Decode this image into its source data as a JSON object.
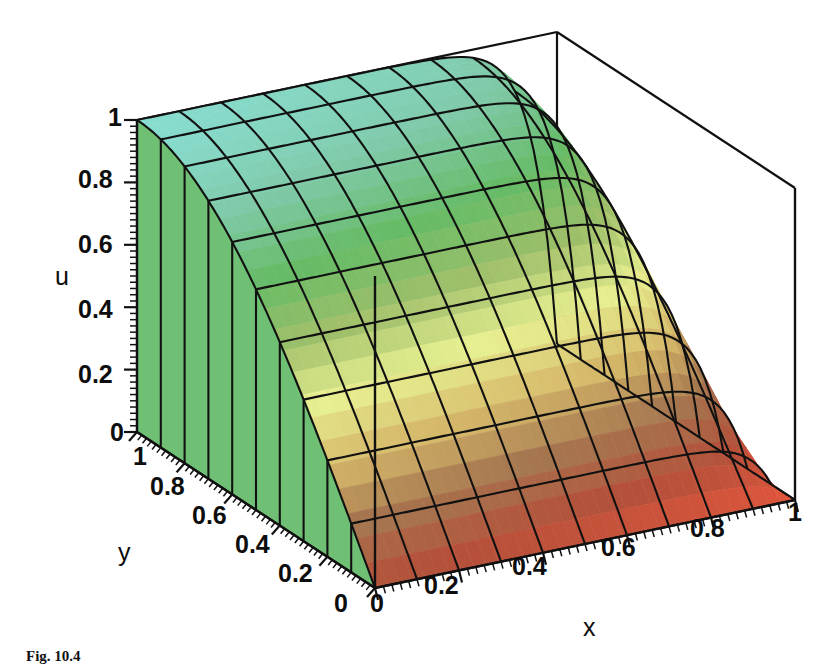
{
  "figure": {
    "caption": "Fig. 10.4",
    "background_color": "#ffffff",
    "line_color": "#111111"
  },
  "axes": {
    "u": {
      "name": "u",
      "name_pos": {
        "x": 55,
        "y": 262
      },
      "ticks": [
        {
          "label": "1",
          "value": 1.0,
          "x": 108,
          "y": 103
        },
        {
          "label": "0.8",
          "value": 0.8,
          "x": 78,
          "y": 165
        },
        {
          "label": "0.6",
          "value": 0.6,
          "x": 78,
          "y": 230
        },
        {
          "label": "0.4",
          "value": 0.4,
          "x": 78,
          "y": 295
        },
        {
          "label": "0.2",
          "value": 0.2,
          "x": 78,
          "y": 360
        },
        {
          "label": "0",
          "value": 0.0,
          "x": 110,
          "y": 418
        }
      ]
    },
    "y": {
      "name": "y",
      "name_pos": {
        "x": 118,
        "y": 538
      },
      "ticks": [
        {
          "label": "1",
          "value": 1.0,
          "x": 133,
          "y": 442
        },
        {
          "label": "0.8",
          "value": 0.8,
          "x": 150,
          "y": 472
        },
        {
          "label": "0.6",
          "value": 0.6,
          "x": 192,
          "y": 501
        },
        {
          "label": "0.4",
          "value": 0.4,
          "x": 235,
          "y": 530
        },
        {
          "label": "0.2",
          "value": 0.2,
          "x": 278,
          "y": 559
        },
        {
          "label": "0",
          "value": 0.0,
          "x": 334,
          "y": 589
        }
      ]
    },
    "x": {
      "name": "x",
      "name_pos": {
        "x": 583,
        "y": 613
      },
      "ticks": [
        {
          "label": "0",
          "value": 0.0,
          "x": 370,
          "y": 589
        },
        {
          "label": "0.2",
          "value": 0.2,
          "x": 424,
          "y": 571
        },
        {
          "label": "0.4",
          "value": 0.4,
          "x": 512,
          "y": 552
        },
        {
          "label": "0.6",
          "value": 0.6,
          "x": 601,
          "y": 533
        },
        {
          "label": "0.8",
          "value": 0.8,
          "x": 690,
          "y": 514
        },
        {
          "label": "1",
          "value": 1.0,
          "x": 788,
          "y": 498
        }
      ]
    }
  },
  "chart_data": {
    "type": "surface3d",
    "title": "",
    "xlabel": "x",
    "ylabel": "y",
    "zlabel": "u",
    "xlim": [
      0,
      1
    ],
    "ylim": [
      0,
      1
    ],
    "zlim": [
      0,
      1
    ],
    "grid": true,
    "legend": "none",
    "mesh_nx": 11,
    "mesh_ny": 11,
    "colormap": [
      "#88ddd0",
      "#7fc9a8",
      "#66bb66",
      "#9fbf6a",
      "#e7ef90",
      "#d6b96a",
      "#a5764f",
      "#b4503a",
      "#e2563c"
    ],
    "x": [
      0,
      0.1,
      0.2,
      0.3,
      0.4,
      0.5,
      0.6,
      0.7,
      0.8,
      0.9,
      1.0
    ],
    "y": [
      0,
      0.1,
      0.2,
      0.3,
      0.4,
      0.5,
      0.6,
      0.7,
      0.8,
      0.9,
      1.0
    ],
    "z_rows": [
      {
        "y": 1.0,
        "values": [
          1.0,
          1.0,
          1.0,
          1.0,
          1.0,
          1.0,
          1.0,
          1.0,
          1.0,
          1.0,
          0.0
        ]
      },
      {
        "y": 0.9,
        "values": [
          0.97,
          0.97,
          0.97,
          0.97,
          0.97,
          0.97,
          0.97,
          0.96,
          0.95,
          0.9,
          0.0
        ]
      },
      {
        "y": 0.8,
        "values": [
          0.92,
          0.92,
          0.92,
          0.92,
          0.92,
          0.92,
          0.91,
          0.9,
          0.87,
          0.78,
          0.0
        ]
      },
      {
        "y": 0.7,
        "values": [
          0.84,
          0.84,
          0.84,
          0.84,
          0.84,
          0.83,
          0.82,
          0.8,
          0.75,
          0.63,
          0.0
        ]
      },
      {
        "y": 0.6,
        "values": [
          0.74,
          0.74,
          0.74,
          0.74,
          0.73,
          0.72,
          0.71,
          0.68,
          0.62,
          0.49,
          0.0
        ]
      },
      {
        "y": 0.5,
        "values": [
          0.62,
          0.62,
          0.62,
          0.62,
          0.61,
          0.6,
          0.58,
          0.55,
          0.49,
          0.37,
          0.0
        ]
      },
      {
        "y": 0.4,
        "values": [
          0.5,
          0.5,
          0.5,
          0.49,
          0.48,
          0.47,
          0.45,
          0.42,
          0.37,
          0.27,
          0.0
        ]
      },
      {
        "y": 0.3,
        "values": [
          0.37,
          0.37,
          0.37,
          0.36,
          0.35,
          0.34,
          0.32,
          0.3,
          0.26,
          0.18,
          0.0
        ]
      },
      {
        "y": 0.2,
        "values": [
          0.24,
          0.24,
          0.24,
          0.23,
          0.23,
          0.22,
          0.2,
          0.18,
          0.15,
          0.1,
          0.0
        ]
      },
      {
        "y": 0.1,
        "values": [
          0.12,
          0.12,
          0.12,
          0.11,
          0.11,
          0.1,
          0.09,
          0.08,
          0.07,
          0.04,
          0.0
        ]
      },
      {
        "y": 0.0,
        "values": [
          0.0,
          0.0,
          0.0,
          0.0,
          0.0,
          0.0,
          0.0,
          0.0,
          0.0,
          0.0,
          0.0
        ]
      }
    ],
    "box_corners": {
      "front_bottom": {
        "x": 375,
        "y": 588
      },
      "left_bottom": {
        "x": 137,
        "y": 432
      },
      "left_top": {
        "x": 137,
        "y": 120
      },
      "back_top": {
        "x": 556,
        "y": 30
      },
      "back_bottom": {
        "x": 556,
        "y": 338
      },
      "right_top": {
        "x": 795,
        "y": 192
      },
      "right_bottom": {
        "x": 795,
        "y": 500
      }
    }
  }
}
